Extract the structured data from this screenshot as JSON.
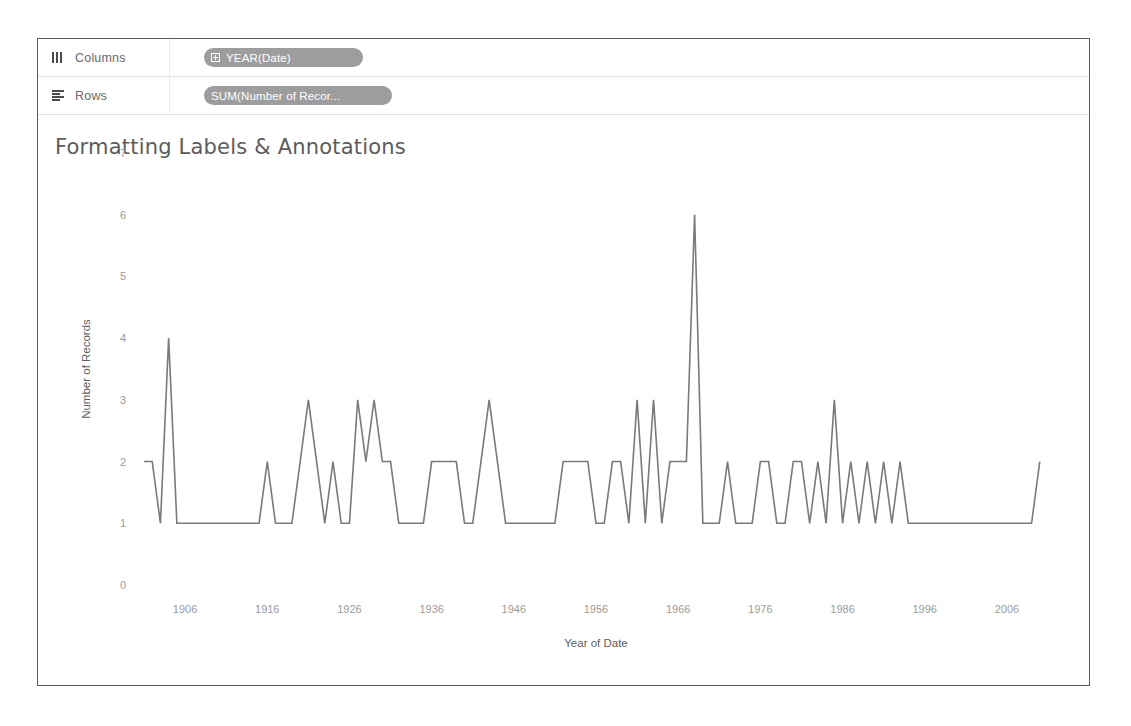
{
  "shelves": [
    {
      "icon": "columns-icon",
      "label": "Columns",
      "pill": {
        "text": "YEAR(Date)",
        "icon": "expand-plus-icon",
        "color": "#9d9d9d"
      }
    },
    {
      "icon": "rows-icon",
      "label": "Rows",
      "pill": {
        "text": "SUM(Number of Recor...",
        "icon": "none",
        "color": "#9d9d9d"
      }
    }
  ],
  "view": {
    "title": "Formatting Labels & Annotations",
    "title_color": "#5c5c5c"
  },
  "chart_data": {
    "type": "line",
    "title": "Formatting Labels & Annotations",
    "xlabel": "Year of Date",
    "ylabel": "Number of Records",
    "ylim": [
      0,
      7
    ],
    "yticks": [
      0,
      1,
      2,
      3,
      4,
      5,
      6,
      7
    ],
    "xlim": [
      1901,
      2011
    ],
    "xticks": [
      1906,
      1916,
      1926,
      1936,
      1946,
      1956,
      1966,
      1976,
      1986,
      1996,
      2006
    ],
    "grid": false,
    "legend": "none",
    "line_color": "#7a7a7a",
    "x": [
      1901,
      1902,
      1903,
      1904,
      1905,
      1906,
      1907,
      1908,
      1909,
      1910,
      1911,
      1912,
      1913,
      1914,
      1915,
      1916,
      1917,
      1918,
      1919,
      1920,
      1921,
      1922,
      1923,
      1924,
      1925,
      1926,
      1927,
      1928,
      1929,
      1930,
      1931,
      1932,
      1933,
      1934,
      1935,
      1936,
      1937,
      1938,
      1939,
      1940,
      1941,
      1942,
      1943,
      1944,
      1945,
      1946,
      1947,
      1948,
      1949,
      1950,
      1951,
      1952,
      1953,
      1954,
      1955,
      1956,
      1957,
      1958,
      1959,
      1960,
      1961,
      1962,
      1963,
      1964,
      1965,
      1966,
      1967,
      1968,
      1969,
      1970,
      1971,
      1972,
      1973,
      1974,
      1975,
      1976,
      1977,
      1978,
      1979,
      1980,
      1981,
      1982,
      1983,
      1984,
      1985,
      1986,
      1987,
      1988,
      1989,
      1990,
      1991,
      1992,
      1993,
      1994,
      1995,
      1996,
      1997,
      1998,
      1999,
      2000,
      2001,
      2002,
      2003,
      2004,
      2005,
      2006,
      2007,
      2008,
      2009,
      2010
    ],
    "values": [
      2,
      2,
      1,
      4,
      1,
      1,
      1,
      1,
      1,
      1,
      1,
      1,
      1,
      1,
      1,
      2,
      1,
      1,
      1,
      2,
      3,
      2,
      1,
      2,
      1,
      1,
      3,
      2,
      3,
      2,
      2,
      1,
      1,
      1,
      1,
      2,
      2,
      2,
      2,
      1,
      1,
      2,
      3,
      2,
      1,
      1,
      1,
      1,
      1,
      1,
      1,
      2,
      2,
      2,
      2,
      1,
      1,
      2,
      2,
      1,
      3,
      1,
      3,
      1,
      2,
      2,
      2,
      6,
      1,
      1,
      1,
      2,
      1,
      1,
      1,
      2,
      2,
      1,
      1,
      2,
      2,
      1,
      2,
      1,
      3,
      1,
      2,
      1,
      2,
      1,
      2,
      1,
      2,
      1,
      1,
      1,
      1,
      1,
      1,
      1,
      1,
      1,
      1,
      1,
      1,
      1,
      1,
      1,
      1,
      2
    ],
    "series": [
      {
        "name": "SUM(Number of Records)",
        "values": [
          2,
          2,
          1,
          4,
          1,
          1,
          1,
          1,
          1,
          1,
          1,
          1,
          1,
          1,
          1,
          2,
          1,
          1,
          1,
          2,
          3,
          2,
          1,
          2,
          1,
          1,
          3,
          2,
          3,
          2,
          2,
          1,
          1,
          1,
          1,
          2,
          2,
          2,
          2,
          1,
          1,
          2,
          3,
          2,
          1,
          1,
          1,
          1,
          1,
          1,
          1,
          2,
          2,
          2,
          2,
          1,
          1,
          2,
          2,
          1,
          3,
          1,
          3,
          1,
          2,
          2,
          2,
          6,
          1,
          1,
          1,
          2,
          1,
          1,
          1,
          2,
          2,
          1,
          1,
          2,
          2,
          1,
          2,
          1,
          3,
          1,
          2,
          1,
          2,
          1,
          2,
          1,
          2,
          1,
          1,
          1,
          1,
          1,
          1,
          1,
          1,
          1,
          1,
          1,
          1,
          1,
          1,
          1,
          1,
          2
        ]
      }
    ]
  }
}
